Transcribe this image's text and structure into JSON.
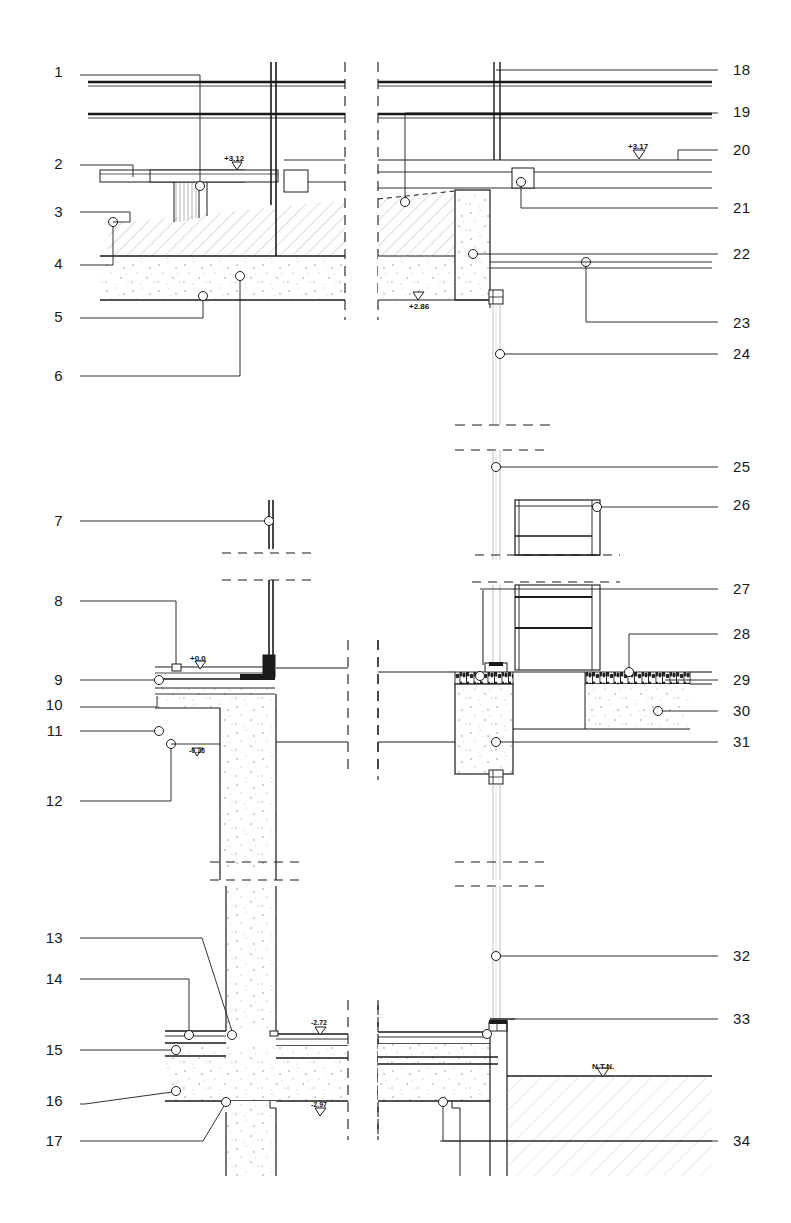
{
  "sheet": {
    "title": "Construction Detail Section Sheet",
    "background_color": "#ffffff",
    "line_color": "#1a1a1a",
    "width": 791,
    "height": 1223
  },
  "callouts": {
    "left_column": [
      {
        "number": "1",
        "x": 63,
        "y": 72
      },
      {
        "number": "2",
        "x": 63,
        "y": 164
      },
      {
        "number": "3",
        "x": 63,
        "y": 212
      },
      {
        "number": "4",
        "x": 63,
        "y": 264
      },
      {
        "number": "5",
        "x": 63,
        "y": 317
      },
      {
        "number": "6",
        "x": 63,
        "y": 376
      },
      {
        "number": "7",
        "x": 63,
        "y": 521
      },
      {
        "number": "8",
        "x": 63,
        "y": 601
      },
      {
        "number": "9",
        "x": 63,
        "y": 680
      },
      {
        "number": "10",
        "x": 63,
        "y": 705
      },
      {
        "number": "11",
        "x": 63,
        "y": 731
      },
      {
        "number": "12",
        "x": 63,
        "y": 801
      },
      {
        "number": "13",
        "x": 63,
        "y": 938
      },
      {
        "number": "14",
        "x": 63,
        "y": 979
      },
      {
        "number": "15",
        "x": 63,
        "y": 1050
      },
      {
        "number": "16",
        "x": 63,
        "y": 1101
      },
      {
        "number": "17",
        "x": 63,
        "y": 1141
      }
    ],
    "right_column": [
      {
        "number": "18",
        "x": 733,
        "y": 70
      },
      {
        "number": "19",
        "x": 733,
        "y": 112
      },
      {
        "number": "20",
        "x": 733,
        "y": 150
      },
      {
        "number": "21",
        "x": 733,
        "y": 208
      },
      {
        "number": "22",
        "x": 733,
        "y": 254
      },
      {
        "number": "23",
        "x": 733,
        "y": 323
      },
      {
        "number": "24",
        "x": 733,
        "y": 354
      },
      {
        "number": "25",
        "x": 733,
        "y": 467
      },
      {
        "number": "26",
        "x": 733,
        "y": 505
      },
      {
        "number": "27",
        "x": 733,
        "y": 589
      },
      {
        "number": "28",
        "x": 733,
        "y": 634
      },
      {
        "number": "29",
        "x": 733,
        "y": 680
      },
      {
        "number": "30",
        "x": 733,
        "y": 711
      },
      {
        "number": "31",
        "x": 733,
        "y": 742
      },
      {
        "number": "32",
        "x": 733,
        "y": 956
      },
      {
        "number": "33",
        "x": 733,
        "y": 1019
      },
      {
        "number": "34",
        "x": 733,
        "y": 1141
      }
    ]
  },
  "elevation_markers": [
    {
      "id": "elev-312",
      "text": "+3.12",
      "x": 224,
      "y": 155
    },
    {
      "id": "elev-317",
      "text": "+3.17",
      "x": 628,
      "y": 143
    },
    {
      "id": "elev-286",
      "text": "+2.86",
      "x": 409,
      "y": 303
    },
    {
      "id": "elev-000",
      "text": "+0.0",
      "x": 190,
      "y": 655
    },
    {
      "id": "elev-m026",
      "text": "-0.26",
      "x": 189,
      "y": 747
    },
    {
      "id": "elev-m272",
      "text": "-2.72",
      "x": 311,
      "y": 1019
    },
    {
      "id": "elev-m297",
      "text": "-2.97",
      "x": 311,
      "y": 1101
    },
    {
      "id": "elev-ntn",
      "text": "N.T.N.",
      "x": 592,
      "y": 1063
    }
  ],
  "details": {
    "top_left": {
      "name": "roof-parapet-detail-left",
      "elevations": [
        "+3.12"
      ]
    },
    "top_right": {
      "name": "roof-parapet-detail-right",
      "elevations": [
        "+3.17",
        "+2.86"
      ]
    },
    "middle_left": {
      "name": "floor-slab-detail-left",
      "elevations": [
        "+0.0",
        "-0.26"
      ]
    },
    "middle_right": {
      "name": "window-sill-detail-right",
      "elevations": []
    },
    "bottom_left": {
      "name": "foundation-detail-left",
      "elevations": [
        "-2.72",
        "-2.97"
      ]
    },
    "bottom_right": {
      "name": "foundation-detail-right",
      "elevations": [
        "N.T.N."
      ]
    }
  },
  "legend": {
    "hatch_concrete": "#f2f2f2",
    "hatch_stipple": "#fafafa",
    "gravel_fill": "#2a2a2a"
  }
}
